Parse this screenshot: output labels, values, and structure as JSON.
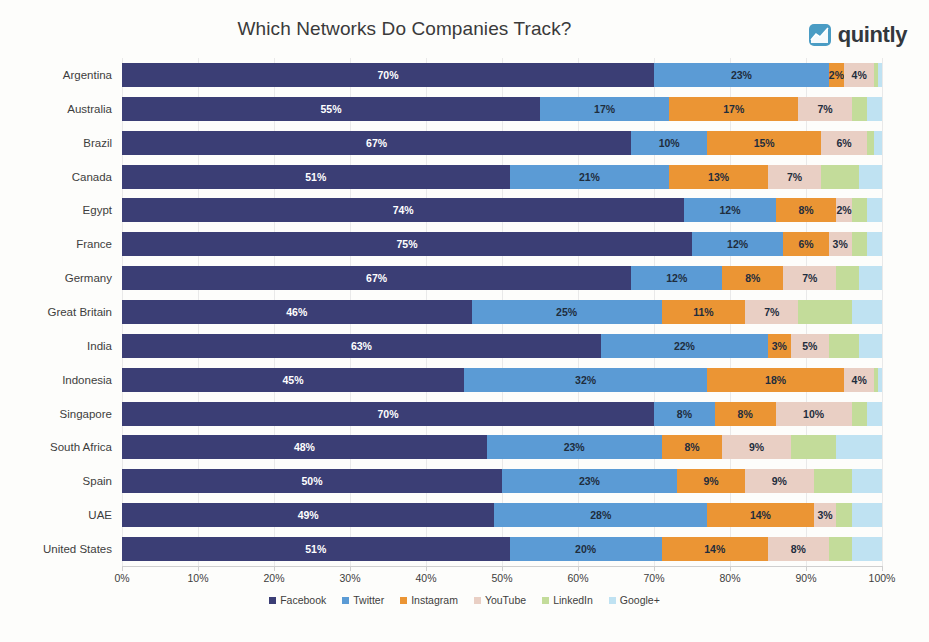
{
  "header": {
    "title": "Which Networks Do Companies Track?",
    "brand_name": "quintly",
    "brand_icon": "line-chart-icon"
  },
  "chart_data": {
    "type": "bar",
    "orientation": "horizontal",
    "stacked": true,
    "stack_mode": "percent",
    "title": "Which Networks Do Companies Track?",
    "xlabel": "",
    "ylabel": "",
    "xlim": [
      0,
      100
    ],
    "grid": true,
    "legend_position": "bottom",
    "xticks": [
      "0%",
      "10%",
      "20%",
      "30%",
      "40%",
      "50%",
      "60%",
      "70%",
      "80%",
      "90%",
      "100%"
    ],
    "xtick_values": [
      0,
      10,
      20,
      30,
      40,
      50,
      60,
      70,
      80,
      90,
      100
    ],
    "categories": [
      "Argentina",
      "Australia",
      "Brazil",
      "Canada",
      "Egypt",
      "France",
      "Germany",
      "Great Britain",
      "India",
      "Indonesia",
      "Singapore",
      "South Africa",
      "Spain",
      "UAE",
      "United States"
    ],
    "series": [
      {
        "name": "Facebook",
        "color": "#3b3e75",
        "label_color": "#ffffff",
        "values": [
          70,
          55,
          67,
          51,
          74,
          75,
          67,
          46,
          63,
          45,
          70,
          48,
          50,
          49,
          51
        ]
      },
      {
        "name": "Twitter",
        "color": "#5b9bd5",
        "label_color": "#1f2d3d",
        "values": [
          23,
          17,
          10,
          21,
          12,
          12,
          12,
          25,
          22,
          32,
          8,
          23,
          23,
          28,
          20
        ]
      },
      {
        "name": "Instagram",
        "color": "#eb9534",
        "label_color": "#1f2d3d",
        "values": [
          2,
          17,
          15,
          13,
          8,
          6,
          8,
          11,
          3,
          18,
          8,
          8,
          9,
          14,
          14
        ]
      },
      {
        "name": "YouTube",
        "color": "#e9cfc4",
        "label_color": "#1f2d3d",
        "values": [
          4,
          7,
          6,
          7,
          2,
          3,
          7,
          7,
          5,
          4,
          10,
          9,
          9,
          3,
          8
        ]
      },
      {
        "name": "LinkedIn",
        "color": "#c3dc9a",
        "label_color": "#1f2d3d",
        "values": [
          0.5,
          2,
          1,
          5,
          2,
          2,
          3,
          7,
          4,
          0.5,
          2,
          6,
          5,
          2,
          3
        ]
      },
      {
        "name": "Google+",
        "color": "#bfe2f2",
        "label_color": "#1f2d3d",
        "values": [
          0.5,
          2,
          1,
          3,
          2,
          2,
          3,
          4,
          3,
          0.5,
          2,
          6,
          4,
          4,
          4
        ]
      }
    ],
    "labeled_values": {
      "Argentina": [
        "70%",
        "23%",
        "2%",
        "4%",
        "",
        ""
      ],
      "Australia": [
        "55%",
        "17%",
        "17%",
        "7%",
        "",
        ""
      ],
      "Brazil": [
        "67%",
        "10%",
        "15%",
        "6%",
        "",
        ""
      ],
      "Canada": [
        "51%",
        "21%",
        "13%",
        "7%",
        "",
        ""
      ],
      "Egypt": [
        "74%",
        "12%",
        "8%",
        "2%",
        "",
        ""
      ],
      "France": [
        "75%",
        "12%",
        "6%",
        "3%",
        "",
        ""
      ],
      "Germany": [
        "67%",
        "12%",
        "8%",
        "7%",
        "",
        ""
      ],
      "Great Britain": [
        "46%",
        "25%",
        "11%",
        "7%",
        "",
        ""
      ],
      "India": [
        "63%",
        "22%",
        "3%",
        "5%",
        "",
        ""
      ],
      "Indonesia": [
        "45%",
        "32%",
        "18%",
        "4%",
        "",
        ""
      ],
      "Singapore": [
        "70%",
        "8%",
        "8%",
        "10%",
        "",
        ""
      ],
      "South Africa": [
        "48%",
        "23%",
        "8%",
        "9%",
        "",
        ""
      ],
      "Spain": [
        "50%",
        "23%",
        "9%",
        "9%",
        "",
        ""
      ],
      "UAE": [
        "49%",
        "28%",
        "14%",
        "3%",
        "",
        ""
      ],
      "United States": [
        "51%",
        "20%",
        "14%",
        "8%",
        "",
        ""
      ]
    }
  }
}
